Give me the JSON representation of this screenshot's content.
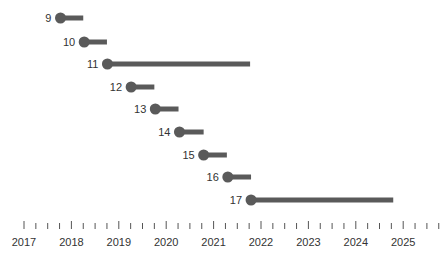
{
  "chart_data": {
    "type": "timeline",
    "title": "",
    "xlabel": "",
    "ylabel": "",
    "xlim": [
      2016.97,
      2025.9
    ],
    "grid": false,
    "legend": null,
    "x_ticks": [
      "2017",
      "2018",
      "2019",
      "2020",
      "2021",
      "2022",
      "2023",
      "2024",
      "2025"
    ],
    "minor_ticks_per_year": 4,
    "colors": {
      "bar": "#5a5a5a",
      "dot": "#5a5a5a",
      "axis": "#555555",
      "text": "#333333"
    },
    "series": [
      {
        "label": "9",
        "start": 2017.77,
        "end": 2018.25
      },
      {
        "label": "10",
        "start": 2018.27,
        "end": 2018.75
      },
      {
        "label": "11",
        "start": 2018.76,
        "end": 2021.77
      },
      {
        "label": "12",
        "start": 2019.26,
        "end": 2019.75
      },
      {
        "label": "13",
        "start": 2019.77,
        "end": 2020.26
      },
      {
        "label": "14",
        "start": 2020.28,
        "end": 2020.79
      },
      {
        "label": "15",
        "start": 2020.79,
        "end": 2021.28
      },
      {
        "label": "16",
        "start": 2021.3,
        "end": 2021.79
      },
      {
        "label": "17",
        "start": 2021.79,
        "end": 2024.79
      }
    ]
  }
}
